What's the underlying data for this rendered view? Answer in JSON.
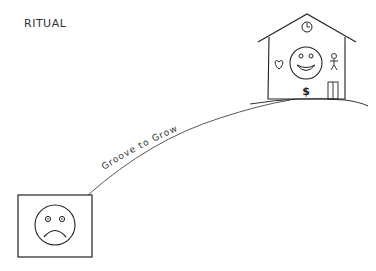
{
  "title": "RITUAL",
  "path": {
    "label": "Groove to Grow"
  },
  "start": {
    "name": "sad-face-frame",
    "emotion": "sad"
  },
  "destination": {
    "name": "house",
    "emotion": "happy",
    "symbols": [
      "clock",
      "heart",
      "stick-figure",
      "dollar",
      "door"
    ],
    "dollar_symbol": "$"
  },
  "colors": {
    "ink": "#222222",
    "background": "#ffffff"
  }
}
